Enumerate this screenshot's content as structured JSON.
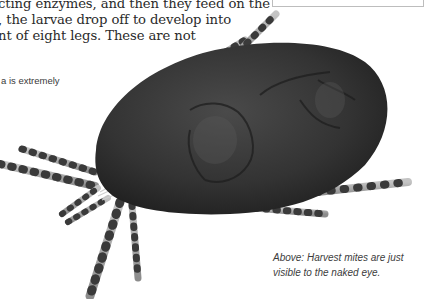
{
  "body_text": {
    "lines": [
      "cting enzymes, and then they feed on the",
      ", the larvae drop off to develop into",
      "nt of eight legs. These are not"
    ]
  },
  "sidebar_fragment": {
    "text": "a is extremely"
  },
  "illustration": {
    "subject": "harvest-mite",
    "body_color": "#2b2b2b",
    "leg_color": "#9a9a9a",
    "leg_segment_color": "#3a3a3a"
  },
  "caption": {
    "lines": [
      "Above: Harvest mites are just",
      "visible to the naked eye."
    ]
  },
  "colors": {
    "background": "#ffffff",
    "text": "#2a2a2a",
    "caption_text": "#3c3c3c",
    "box_border": "#bdbdbd"
  }
}
